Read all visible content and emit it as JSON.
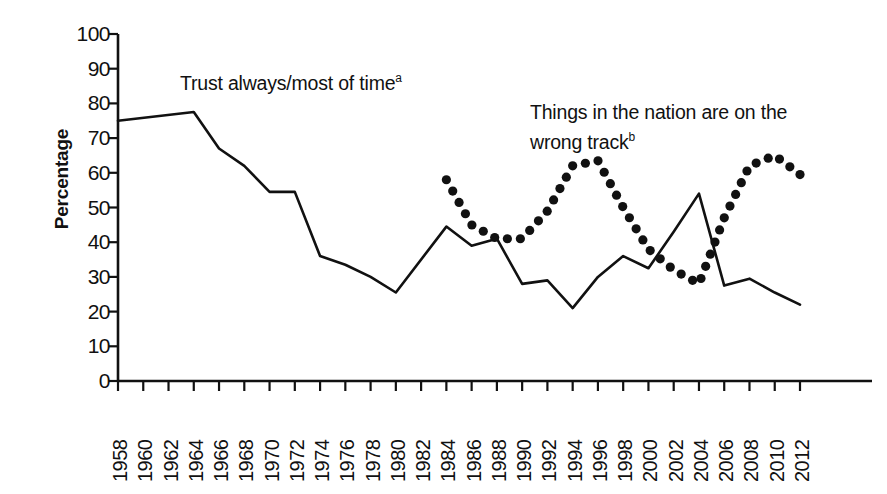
{
  "chart_data": {
    "type": "line",
    "title": "",
    "xlabel": "",
    "ylabel": "Percentage",
    "ylim": [
      0,
      100
    ],
    "ytick_step": 10,
    "yticks": [
      100,
      90,
      80,
      70,
      60,
      50,
      40,
      30,
      20,
      10,
      0
    ],
    "xlim": [
      1958,
      2012
    ],
    "xtick_step": 2,
    "categories": [
      1958,
      1960,
      1962,
      1964,
      1966,
      1968,
      1970,
      1972,
      1974,
      1976,
      1978,
      1980,
      1982,
      1984,
      1986,
      1988,
      1990,
      1992,
      1994,
      1996,
      1998,
      2000,
      2002,
      2004,
      2006,
      2008,
      2010,
      2012
    ],
    "grid": false,
    "legend_position": "inline-annotations",
    "series": [
      {
        "name": "Trust always/most of time",
        "footnote": "a",
        "style": "solid",
        "color": "#111111",
        "x": [
          1958,
          1964,
          1966,
          1968,
          1970,
          1972,
          1974,
          1976,
          1978,
          1980,
          1984,
          1986,
          1988,
          1990,
          1992,
          1994,
          1996,
          1998,
          2000,
          2002,
          2004,
          2006,
          2008,
          2010,
          2012
        ],
        "values": [
          75,
          77.5,
          67,
          62,
          54.5,
          54.5,
          36,
          33.5,
          30,
          25.5,
          44.5,
          39,
          41,
          28,
          29,
          21,
          30,
          36,
          32.5,
          43,
          54,
          27.5,
          29.5,
          25.5,
          22
        ]
      },
      {
        "name": "Things in the nation are on the wrong track",
        "footnote": "b",
        "style": "dotted",
        "color": "#111111",
        "x": [
          1984,
          1986,
          1988,
          1990,
          1992,
          1994,
          1996,
          1998,
          2000,
          2002,
          2004,
          2006,
          2008,
          2010,
          2012
        ],
        "values": [
          58,
          45,
          41,
          41,
          49,
          62,
          63.5,
          50,
          38,
          32,
          28,
          47,
          62,
          65,
          59.5
        ]
      }
    ],
    "annotations": [
      {
        "id": "annotation-trust",
        "text": "Trust always/most of time",
        "footnote": "a",
        "x_px": 180,
        "y_px": 66
      },
      {
        "id": "annotation-wrong-track",
        "text": "Things in the nation are on the\nwrong track",
        "footnote": "b",
        "x_px": 530,
        "y_px": 100
      }
    ]
  },
  "axes": {
    "y_title": "Percentage",
    "y_labels": [
      "100",
      "90",
      "80",
      "70",
      "60",
      "50",
      "40",
      "30",
      "20",
      "10",
      "0"
    ],
    "x_labels": [
      "1958",
      "1960",
      "1962",
      "1964",
      "1966",
      "1968",
      "1970",
      "1972",
      "1974",
      "1976",
      "1978",
      "1980",
      "1982",
      "1984",
      "1986",
      "1988",
      "1990",
      "1992",
      "1994",
      "1996",
      "1998",
      "2000",
      "2002",
      "2004",
      "2006",
      "2008",
      "2010",
      "2012"
    ]
  },
  "colors": {
    "ink": "#111111",
    "background": "#ffffff"
  }
}
